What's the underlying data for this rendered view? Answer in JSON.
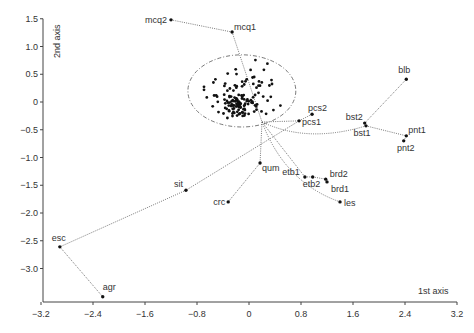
{
  "chart_data": {
    "type": "scatter",
    "title": "",
    "xlabel": "1st axis",
    "ylabel": "2nd axis",
    "xlim": [
      -3.2,
      3.2
    ],
    "ylim": [
      -3.6,
      1.5
    ],
    "grid": false,
    "legend": null,
    "x_ticks": [
      -3.2,
      -2.4,
      -1.6,
      -0.8,
      0,
      0.8,
      1.6,
      2.4,
      3.2
    ],
    "x_tick_labels": [
      "−3.2",
      "−2.4",
      "−1.6",
      "−0.8",
      "0",
      "0.8",
      "1.6",
      "2.4",
      "3.2"
    ],
    "y_ticks": [
      1.5,
      1.0,
      0.5,
      0,
      -0.5,
      -1.0,
      -1.5,
      -2.0,
      -2.5,
      -3.0
    ],
    "y_tick_labels": [
      "1.5",
      "1.0",
      "0.5",
      "0",
      "−0.5",
      "−1.0",
      "−1.5",
      "−2.0",
      "−2.5",
      "−3.0"
    ],
    "labeled_points": [
      {
        "label": "mcq2",
        "x": -1.2,
        "y": 1.48
      },
      {
        "label": "mcq1",
        "x": -0.26,
        "y": 1.26
      },
      {
        "label": "blb",
        "x": 2.42,
        "y": 0.41
      },
      {
        "label": "bst2",
        "x": 1.78,
        "y": -0.38
      },
      {
        "label": "bst1",
        "x": 1.8,
        "y": -0.43
      },
      {
        "label": "pcs2",
        "x": 0.97,
        "y": -0.22
      },
      {
        "label": "pcs1",
        "x": 0.77,
        "y": -0.34
      },
      {
        "label": "pnt1",
        "x": 2.42,
        "y": -0.61
      },
      {
        "label": "pnt2",
        "x": 2.38,
        "y": -0.7
      },
      {
        "label": "qum",
        "x": 0.17,
        "y": -1.1
      },
      {
        "label": "etb1",
        "x": 0.86,
        "y": -1.35
      },
      {
        "label": "etb2",
        "x": 0.98,
        "y": -1.35
      },
      {
        "label": "brd2",
        "x": 1.18,
        "y": -1.39
      },
      {
        "label": "brd1",
        "x": 1.2,
        "y": -1.44
      },
      {
        "label": "les",
        "x": 1.4,
        "y": -1.8
      },
      {
        "label": "crc",
        "x": -0.32,
        "y": -1.8
      },
      {
        "label": "sit",
        "x": -0.97,
        "y": -1.59
      },
      {
        "label": "esc",
        "x": -2.91,
        "y": -2.61
      },
      {
        "label": "agr",
        "x": -2.25,
        "y": -3.51
      }
    ],
    "branch_node": {
      "x": 0.2,
      "y": -0.36
    },
    "connections": [
      [
        "mcq2",
        "mcq1"
      ],
      [
        "mcq1",
        "node"
      ],
      [
        "node",
        "pcs1"
      ],
      [
        "pcs1",
        "pcs2"
      ],
      [
        "node",
        "bst1"
      ],
      [
        "bst2",
        "blb"
      ],
      [
        "bst1",
        "pnt1"
      ],
      [
        "pnt1",
        "pnt2"
      ],
      [
        "node",
        "qum"
      ],
      [
        "qum",
        "crc"
      ],
      [
        "node",
        "etb1"
      ],
      [
        "etb1",
        "etb2"
      ],
      [
        "etb2",
        "brd2"
      ],
      [
        "brd2",
        "brd1"
      ],
      [
        "node",
        "les"
      ],
      [
        "pcs1",
        "sit"
      ],
      [
        "sit",
        "esc"
      ],
      [
        "esc",
        "agr"
      ]
    ],
    "ellipse": {
      "cx": -0.11,
      "cy": 0.2,
      "rx": 0.83,
      "ry": 0.65
    },
    "cluster_points_note": "dense unlabeled cloud of ~150 points centered near (-0.1, 0.0) inside the ellipse"
  },
  "labels": {
    "xlabel": "1st axis",
    "ylabel": "2nd axis"
  }
}
